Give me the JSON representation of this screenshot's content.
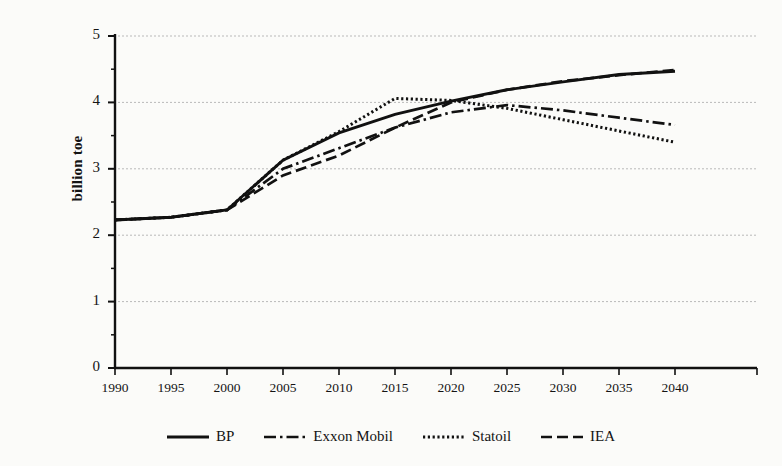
{
  "chart_data": {
    "type": "line",
    "title": "",
    "xlabel": "",
    "ylabel": "billion toe",
    "xlim": [
      1988,
      2046
    ],
    "ylim": [
      0,
      5
    ],
    "grid": true,
    "grid_style": "dotted-horizontal",
    "legend_position": "bottom-center",
    "x_ticks": [
      1990,
      1995,
      2000,
      2005,
      2010,
      2015,
      2020,
      2025,
      2030,
      2035,
      2040
    ],
    "y_ticks": [
      0,
      1,
      2,
      3,
      4,
      5
    ],
    "y_minor_ticks": [
      0.5,
      1.5,
      2.5,
      3.5,
      4.5
    ],
    "x": [
      1990,
      1995,
      2000,
      2005,
      2010,
      2015,
      2020,
      2025,
      2030,
      2035,
      2040
    ],
    "series": [
      {
        "name": "BP",
        "line_style": "solid",
        "color": "#111111",
        "values": [
          2.23,
          2.27,
          2.38,
          3.13,
          3.54,
          3.82,
          4.02,
          4.19,
          4.31,
          4.42,
          4.47
        ]
      },
      {
        "name": "Exxon Mobil",
        "line_style": "dash-dot",
        "color": "#111111",
        "values": [
          2.23,
          2.27,
          2.38,
          3.0,
          3.31,
          3.62,
          3.85,
          3.96,
          3.88,
          3.77,
          3.66
        ]
      },
      {
        "name": "Statoil",
        "line_style": "dotted",
        "color": "#111111",
        "values": [
          2.23,
          2.27,
          2.38,
          3.13,
          3.56,
          4.06,
          4.03,
          3.91,
          3.74,
          3.57,
          3.4
        ]
      },
      {
        "name": "IEA",
        "line_style": "dashed",
        "color": "#111111",
        "values": [
          2.23,
          2.27,
          2.38,
          2.9,
          3.2,
          3.62,
          4.0,
          4.19,
          4.32,
          4.41,
          4.49
        ]
      }
    ]
  },
  "axis": {
    "y_tick_labels": [
      "5",
      "4",
      "3",
      "2",
      "1",
      "0"
    ],
    "x_tick_labels": [
      "1990",
      "1995",
      "2000",
      "2005",
      "2010",
      "2015",
      "2020",
      "2025",
      "2030",
      "2035",
      "2040"
    ],
    "y_axis_title": "billion toe"
  },
  "legend": {
    "items": [
      {
        "label": "BP",
        "style": "solid"
      },
      {
        "label": "Exxon Mobil",
        "style": "dash-dot"
      },
      {
        "label": "Statoil",
        "style": "dotted"
      },
      {
        "label": "IEA",
        "style": "dashed"
      }
    ]
  },
  "colors": {
    "ink": "#111111",
    "grid": "#b9b9b9",
    "background": "#fbfbf9"
  }
}
